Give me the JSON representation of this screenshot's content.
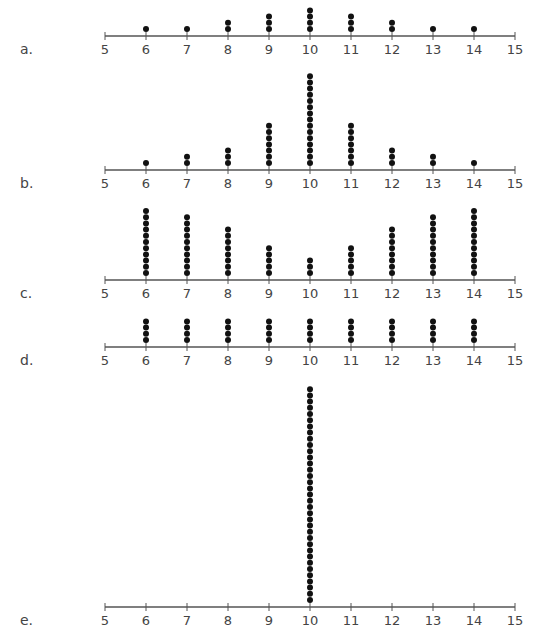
{
  "chart_data": [
    {
      "type": "dot-plot",
      "label": "a.",
      "axis_y": 36,
      "xlim": [
        5,
        15
      ],
      "tick_labels": [
        "5",
        "6",
        "7",
        "8",
        "9",
        "10",
        "11",
        "12",
        "13",
        "14",
        "15"
      ],
      "categories": [
        6,
        7,
        8,
        9,
        10,
        11,
        12,
        13,
        14
      ],
      "values": [
        1,
        1,
        2,
        3,
        4,
        3,
        2,
        1,
        1
      ]
    },
    {
      "type": "dot-plot",
      "label": "b.",
      "axis_y": 170,
      "xlim": [
        5,
        15
      ],
      "tick_labels": [
        "5",
        "6",
        "7",
        "8",
        "9",
        "10",
        "11",
        "12",
        "13",
        "14",
        "15"
      ],
      "categories": [
        6,
        7,
        8,
        9,
        10,
        11,
        12,
        13,
        14
      ],
      "values": [
        1,
        2,
        3,
        7,
        15,
        7,
        3,
        2,
        1
      ]
    },
    {
      "type": "dot-plot",
      "label": "c.",
      "axis_y": 280,
      "xlim": [
        5,
        15
      ],
      "tick_labels": [
        "5",
        "6",
        "7",
        "8",
        "9",
        "10",
        "11",
        "12",
        "13",
        "14",
        "15"
      ],
      "categories": [
        6,
        7,
        8,
        9,
        10,
        11,
        12,
        13,
        14
      ],
      "values": [
        11,
        10,
        8,
        5,
        3,
        5,
        8,
        10,
        11
      ]
    },
    {
      "type": "dot-plot",
      "label": "d.",
      "axis_y": 347,
      "xlim": [
        5,
        15
      ],
      "tick_labels": [
        "5",
        "6",
        "7",
        "8",
        "9",
        "10",
        "11",
        "12",
        "13",
        "14",
        "15"
      ],
      "categories": [
        6,
        7,
        8,
        9,
        10,
        11,
        12,
        13,
        14
      ],
      "values": [
        4,
        4,
        4,
        4,
        4,
        4,
        4,
        4,
        4
      ]
    },
    {
      "type": "dot-plot",
      "label": "e.",
      "axis_y": 607,
      "xlim": [
        5,
        15
      ],
      "tick_labels": [
        "5",
        "6",
        "7",
        "8",
        "9",
        "10",
        "11",
        "12",
        "13",
        "14",
        "15"
      ],
      "categories": [
        6,
        7,
        8,
        9,
        10,
        11,
        12,
        13,
        14
      ],
      "values": [
        0,
        0,
        0,
        0,
        35,
        0,
        0,
        0,
        0
      ]
    }
  ],
  "colors": {
    "axis": "#555555",
    "dot": "#111111",
    "text": "#444444"
  }
}
